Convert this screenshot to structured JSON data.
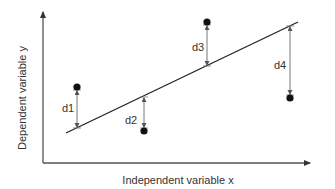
{
  "figure": {
    "x_axis_label": "Independent variable x",
    "y_axis_label": "Dependent variable y",
    "colors": {
      "axis": "#555555",
      "regression_line": "#222222",
      "residual_arrow": "#666666",
      "point": "#111111",
      "text": "#333333"
    }
  },
  "chart_data": {
    "type": "scatter",
    "title": "",
    "xlabel": "Independent variable x",
    "ylabel": "Dependent variable y",
    "grid": false,
    "legend": null,
    "regression_line": {
      "x0": 66,
      "y0": 133,
      "x1": 298,
      "y1": 22
    },
    "points": [
      {
        "label": "d1",
        "cx": 77,
        "cy": 87,
        "line_y": 128,
        "label_x": 62,
        "label_y": 112,
        "position": "above line"
      },
      {
        "label": "d2",
        "cx": 144,
        "cy": 131,
        "line_y": 97,
        "label_x": 125,
        "label_y": 124,
        "position": "below line"
      },
      {
        "label": "d3",
        "cx": 207,
        "cy": 22,
        "line_y": 66,
        "label_x": 192,
        "label_y": 51,
        "position": "above line"
      },
      {
        "label": "d4",
        "cx": 290,
        "cy": 98,
        "line_y": 26,
        "label_x": 274,
        "label_y": 69,
        "position": "below line"
      }
    ],
    "annotations": [
      "d1",
      "d2",
      "d3",
      "d4"
    ]
  }
}
